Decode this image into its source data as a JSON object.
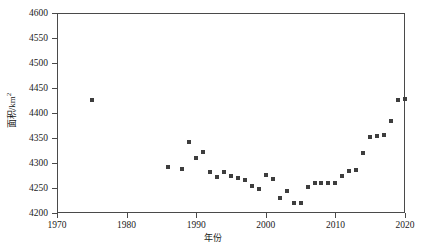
{
  "chart_data": {
    "type": "scatter",
    "title": "",
    "xlabel": "年份",
    "ylabel": "面积/km²",
    "ylabel_main": "面积/km",
    "ylabel_sup": "2",
    "xlim": [
      1970,
      2020
    ],
    "ylim": [
      4200,
      4600
    ],
    "xticks": [
      1970,
      1980,
      1990,
      2000,
      2010,
      2020
    ],
    "yticks": [
      4200,
      4250,
      4300,
      4350,
      4400,
      4450,
      4500,
      4550,
      4600
    ],
    "grid": false,
    "legend": null,
    "marker": "square",
    "marker_color": "#3d3d3d",
    "series": [
      {
        "name": "面积",
        "points": [
          {
            "x": 1975,
            "y": 4427
          },
          {
            "x": 1986,
            "y": 4292
          },
          {
            "x": 1988,
            "y": 4288
          },
          {
            "x": 1989,
            "y": 4342
          },
          {
            "x": 1990,
            "y": 4310
          },
          {
            "x": 1991,
            "y": 4322
          },
          {
            "x": 1992,
            "y": 4283
          },
          {
            "x": 1993,
            "y": 4272
          },
          {
            "x": 1994,
            "y": 4283
          },
          {
            "x": 1995,
            "y": 4275
          },
          {
            "x": 1996,
            "y": 4271
          },
          {
            "x": 1997,
            "y": 4266
          },
          {
            "x": 1998,
            "y": 4254
          },
          {
            "x": 1999,
            "y": 4249
          },
          {
            "x": 2000,
            "y": 4277
          },
          {
            "x": 2001,
            "y": 4269
          },
          {
            "x": 2002,
            "y": 4231
          },
          {
            "x": 2003,
            "y": 4245
          },
          {
            "x": 2004,
            "y": 4221
          },
          {
            "x": 2005,
            "y": 4220
          },
          {
            "x": 2006,
            "y": 4252
          },
          {
            "x": 2007,
            "y": 4261
          },
          {
            "x": 2008,
            "y": 4260
          },
          {
            "x": 2009,
            "y": 4260
          },
          {
            "x": 2010,
            "y": 4260
          },
          {
            "x": 2011,
            "y": 4275
          },
          {
            "x": 2012,
            "y": 4284
          },
          {
            "x": 2013,
            "y": 4287
          },
          {
            "x": 2014,
            "y": 4320
          },
          {
            "x": 2015,
            "y": 4353
          },
          {
            "x": 2016,
            "y": 4355
          },
          {
            "x": 2017,
            "y": 4356
          },
          {
            "x": 2018,
            "y": 4384
          },
          {
            "x": 2019,
            "y": 4427
          },
          {
            "x": 2020,
            "y": 4428
          },
          {
            "x": 2021,
            "y": 4520
          },
          {
            "x": 2022,
            "y": 4541
          }
        ]
      }
    ]
  }
}
